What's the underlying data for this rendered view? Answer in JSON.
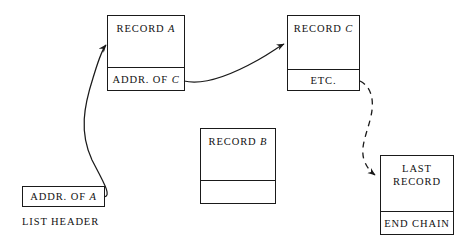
{
  "diagram": {
    "background_color": "#ffffff",
    "line_color": "#1a1a1a"
  },
  "nodes": {
    "record_a": {
      "name_prefix": "RECORD ",
      "name_suffix": "A",
      "pointer_prefix": "ADDR. OF ",
      "pointer_suffix": "C"
    },
    "record_c": {
      "name_prefix": "RECORD ",
      "name_suffix": "C",
      "pointer_label": "ETC."
    },
    "record_b": {
      "name_prefix": "RECORD ",
      "name_suffix": "B",
      "pointer_label": ""
    },
    "last_record": {
      "name_line1": "LAST",
      "name_line2": "RECORD",
      "pointer_label": "END CHAIN"
    },
    "list_header": {
      "pointer_prefix": "ADDR. OF ",
      "pointer_suffix": "A",
      "caption": "LIST HEADER"
    }
  },
  "arrows": [
    {
      "id": "header-to-record-a",
      "from": "list_header",
      "to": "record_a",
      "style": "solid",
      "arrowhead": "true"
    },
    {
      "id": "record-a-to-record-c",
      "from": "record_a",
      "to": "record_c",
      "style": "solid",
      "arrowhead": "true"
    },
    {
      "id": "record-c-to-last-record",
      "from": "record_c",
      "to": "last_record",
      "style": "dashed",
      "arrowhead": "true"
    }
  ]
}
